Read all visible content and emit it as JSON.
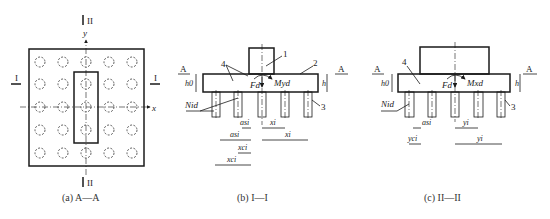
{
  "panels": {
    "a": {
      "caption": "(a) A—A",
      "section_top": "II",
      "section_bottom": "II",
      "section_left": "I",
      "section_right": "I",
      "axis_x": "x",
      "axis_y": "y"
    },
    "b": {
      "caption": "(b) I—I",
      "section_left": "A",
      "section_right": "A",
      "labels": {
        "n1": "1",
        "n2": "2",
        "n3": "3",
        "n4": "4",
        "h0": "h0",
        "h": "h",
        "Fd": "Fd",
        "Myd": "Myd",
        "Nid": "Nid",
        "asi": "asi",
        "ash": "asi",
        "xi_short": "xi",
        "xi_long": "xi",
        "xci_short": "xci",
        "xci_long": "xci"
      }
    },
    "c": {
      "caption": "(c) II—II",
      "section_left": "A",
      "section_right": "A",
      "labels": {
        "n3": "3",
        "n4": "4",
        "h0": "h0",
        "h": "h",
        "Fd": "Fd",
        "Mxd": "Mxd",
        "Nid": "Nid",
        "asi": "asi",
        "yci": "yci",
        "yi_short": "yi",
        "yi_long": "yi"
      }
    }
  },
  "colors": {
    "line": "#1a1a1a",
    "background": "#ffffff"
  }
}
